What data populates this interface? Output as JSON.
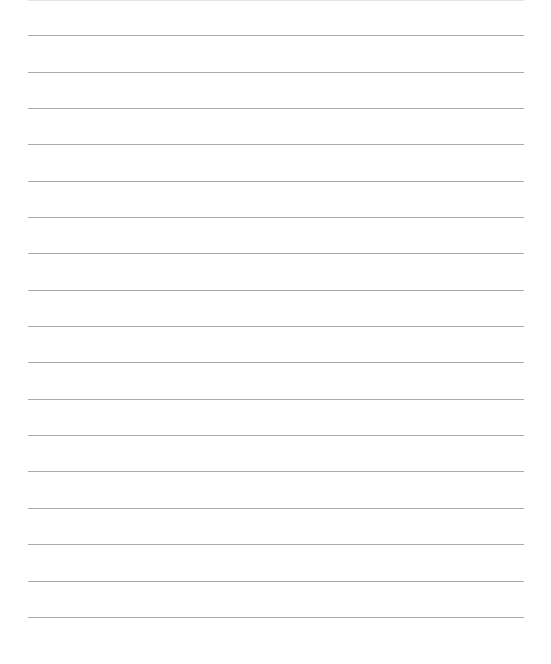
{
  "page": {
    "type": "lined-paper",
    "background_color": "#ffffff",
    "rule_color": "#a9a9a9",
    "line_count": 17,
    "line_positions_y": [
      35,
      72,
      108,
      144,
      181,
      217,
      253,
      290,
      326,
      362,
      399,
      435,
      471,
      508,
      544,
      581,
      617
    ],
    "line_x_start": 28,
    "line_x_end": 524
  }
}
